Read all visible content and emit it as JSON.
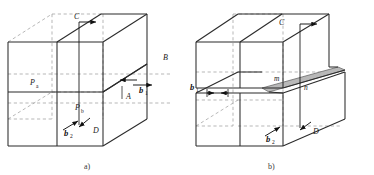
{
  "figure": {
    "background_color": "#ffffff",
    "line_color": "#2b2b2b",
    "dashed_color": "#9a9a9a",
    "shade_color": "#b5b5b5",
    "panels": [
      {
        "id": "panel-a",
        "caption": "a)",
        "caption_x": 84,
        "caption_y": 167,
        "labels": [
          {
            "name": "label-C",
            "text": "C",
            "x": 74,
            "y": 19,
            "style": "italic",
            "size": 8
          },
          {
            "name": "label-B",
            "text": "B",
            "x": 163,
            "y": 60,
            "style": "italic",
            "size": 8
          },
          {
            "name": "label-A",
            "text": "A",
            "x": 126,
            "y": 97,
            "style": "italic",
            "size": 8
          },
          {
            "name": "label-D",
            "text": "D",
            "x": 93,
            "y": 132,
            "style": "italic",
            "size": 8
          },
          {
            "name": "label-Pa",
            "text": "P",
            "x": 30,
            "y": 85,
            "style": "italic",
            "size": 8
          },
          {
            "name": "label-Pa-sub",
            "text": "a",
            "x": 36,
            "y": 88,
            "style": "upright",
            "size": 5.5
          },
          {
            "name": "label-Pb",
            "text": "P",
            "x": 75,
            "y": 110,
            "style": "italic",
            "size": 8
          },
          {
            "name": "label-Pb-sub",
            "text": "b",
            "x": 81,
            "y": 113,
            "style": "upright",
            "size": 5.5
          },
          {
            "name": "label-b1",
            "text": "b",
            "x": 140,
            "y": 89,
            "style": "bold-italic",
            "size": 8.5
          },
          {
            "name": "label-b1-sub",
            "text": "1",
            "x": 146,
            "y": 92,
            "style": "upright",
            "size": 5.5
          },
          {
            "name": "label-b2",
            "text": "b",
            "x": 68,
            "y": 130,
            "style": "bold-italic",
            "size": 8.5
          },
          {
            "name": "label-b2-sub",
            "text": "2",
            "x": 74,
            "y": 133,
            "style": "upright",
            "size": 5.5
          }
        ]
      },
      {
        "id": "panel-b",
        "caption": "b)",
        "caption_x": 268,
        "caption_y": 167,
        "labels": [
          {
            "name": "label-C",
            "text": "C",
            "x": 279,
            "y": 23,
            "style": "italic",
            "size": 8
          },
          {
            "name": "label-m",
            "text": "m",
            "x": 278,
            "y": 76,
            "style": "italic",
            "size": 7.5
          },
          {
            "name": "label-n",
            "text": "n",
            "x": 299,
            "y": 85,
            "style": "italic",
            "size": 7.5
          },
          {
            "name": "label-D",
            "text": "D",
            "x": 292,
            "y": 133,
            "style": "italic",
            "size": 8
          },
          {
            "name": "label-b1",
            "text": "b",
            "x": 192,
            "y": 91,
            "style": "bold-italic",
            "size": 8.5
          },
          {
            "name": "label-b1-sub",
            "text": "1",
            "x": 198,
            "y": 94,
            "style": "upright",
            "size": 5.5
          },
          {
            "name": "label-b2",
            "text": "b",
            "x": 270,
            "y": 136,
            "style": "bold-italic",
            "size": 8.5
          },
          {
            "name": "label-b2-sub",
            "text": "2",
            "x": 276,
            "y": 139,
            "style": "upright",
            "size": 5.5
          }
        ]
      }
    ]
  }
}
